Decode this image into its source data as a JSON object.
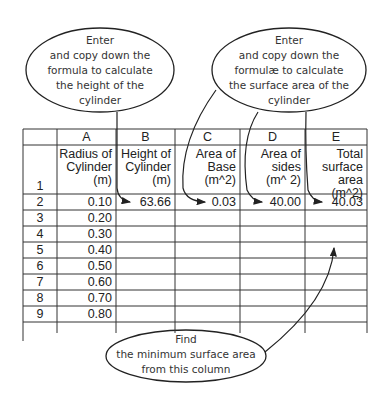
{
  "callouts": {
    "height": {
      "lines": [
        "Enter",
        "and copy down the",
        "formula to calculate",
        "the height of the",
        "cylinder"
      ]
    },
    "surface": {
      "lines": [
        "Enter",
        "and copy down the",
        "formulæ to calculate",
        "the surface area of the",
        "cylinder"
      ]
    },
    "minimum": {
      "lines": [
        "Find",
        "the minimum surface area",
        "from this column"
      ]
    }
  },
  "spreadsheet": {
    "columns": [
      "A",
      "B",
      "C",
      "D",
      "E"
    ],
    "row_numbers": [
      "1",
      "2",
      "3",
      "4",
      "5",
      "6",
      "7",
      "8",
      "9"
    ],
    "headers": {
      "A": [
        "Radius of",
        "Cylinder",
        "(m)"
      ],
      "B": [
        "Height of",
        "Cylinder",
        "(m)"
      ],
      "C": [
        "Area of",
        "Base",
        "(m^2)"
      ],
      "D": [
        "Area of",
        "sides",
        "(m^ 2)"
      ],
      "E": [
        "Total",
        "surface",
        "area (m^2)"
      ]
    },
    "radius_values": [
      "0.10",
      "0.20",
      "0.30",
      "0.40",
      "0.50",
      "0.60",
      "0.70",
      "0.80"
    ],
    "row2": {
      "B": "63.66",
      "C": "0.03",
      "D": "40.00",
      "E": "40.03"
    }
  }
}
